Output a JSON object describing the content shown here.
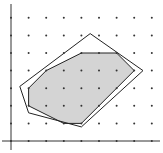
{
  "diagram": {
    "type": "lattice-polygon-integer-hull",
    "origin_px": [
      11,
      141
    ],
    "unit_px": 17.6,
    "grid": {
      "x_range": [
        1,
        8
      ],
      "y_range": [
        0,
        7
      ]
    },
    "axes": {
      "x_end": 160,
      "y_top": 4
    },
    "colors": {
      "fill": "#d4d4d4",
      "stroke": "#222222",
      "dot": "#333333",
      "axis": "#333333"
    },
    "outer_polygon": [
      [
        0.5,
        3.1
      ],
      [
        4.5,
        6.1
      ],
      [
        7.5,
        4.0
      ],
      [
        4.0,
        0.8
      ],
      [
        1.0,
        1.6
      ]
    ],
    "integer_hull": [
      [
        1,
        3
      ],
      [
        2,
        4
      ],
      [
        4,
        5
      ],
      [
        6,
        5
      ],
      [
        7,
        4
      ],
      [
        4,
        1
      ],
      [
        3,
        1
      ],
      [
        1,
        2
      ]
    ]
  }
}
